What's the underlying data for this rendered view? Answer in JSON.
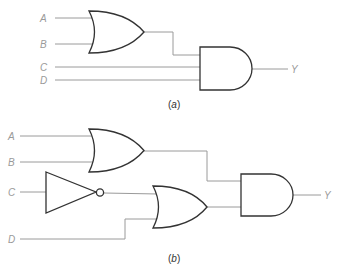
{
  "diagrams": [
    {
      "id": "a",
      "caption_open": "(",
      "caption_letter": "a",
      "caption_close": ")",
      "inputs": [
        "A",
        "B",
        "C",
        "D"
      ],
      "output": "Y",
      "gates": [
        "OR(A,B)",
        "AND(OR(A,B), C, D)"
      ],
      "expression": "Y = (A + B)CD"
    },
    {
      "id": "b",
      "caption_open": "(",
      "caption_letter": "b",
      "caption_close": ")",
      "inputs": [
        "A",
        "B",
        "C",
        "D"
      ],
      "output": "Y",
      "gates": [
        "OR(A,B)",
        "NOT(C)",
        "OR(NOT C, D)",
        "AND(OR(A,B), OR(NOT C, D))"
      ],
      "expression": "Y = (A + B)(C' + D)"
    }
  ],
  "colors": {
    "wire": "#9a9a9a",
    "gate_outline": "#333333",
    "label": "#9a9a9a",
    "background": "#ffffff"
  }
}
